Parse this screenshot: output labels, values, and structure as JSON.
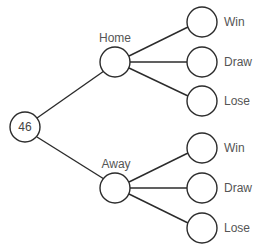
{
  "diagram": {
    "type": "tree-diagram",
    "root": {
      "label": "46"
    },
    "branches": [
      {
        "label": "Home",
        "outcomes": [
          {
            "label": "Win"
          },
          {
            "label": "Draw"
          },
          {
            "label": "Lose"
          }
        ]
      },
      {
        "label": "Away",
        "outcomes": [
          {
            "label": "Win"
          },
          {
            "label": "Draw"
          },
          {
            "label": "Lose"
          }
        ]
      }
    ],
    "colors": {
      "line": "#2b2b2b",
      "text": "#555555",
      "node_fill": "#ffffff"
    }
  }
}
